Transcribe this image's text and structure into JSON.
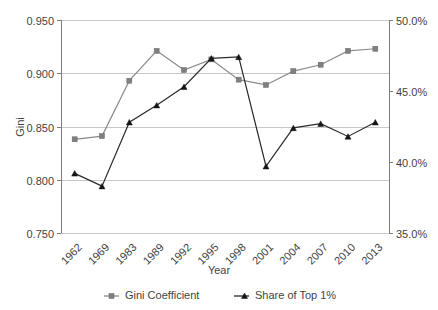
{
  "chart_data": {
    "type": "line",
    "title": "",
    "xlabel": "Year",
    "ylabel": "Gini",
    "ylabel_right": "",
    "categories": [
      "1962",
      "1969",
      "1983",
      "1989",
      "1992",
      "1995",
      "1998",
      "2001",
      "2004",
      "2007",
      "2010",
      "2013"
    ],
    "ylim": [
      0.75,
      0.95
    ],
    "ylim_right": [
      35.0,
      50.0
    ],
    "y_ticks": [
      "0.750",
      "0.800",
      "0.850",
      "0.900",
      "0.950"
    ],
    "y_tick_values": [
      0.75,
      0.8,
      0.85,
      0.9,
      0.95
    ],
    "y_ticks_right": [
      "35.0%",
      "40.0%",
      "45.0%",
      "50.0%"
    ],
    "y_tick_values_right": [
      35.0,
      40.0,
      45.0,
      50.0
    ],
    "grid": true,
    "legend_position": "bottom",
    "series": [
      {
        "name": "Gini Coefficient",
        "axis": "left",
        "marker": "square",
        "color": "#7f7f7f",
        "values": [
          0.838,
          0.841,
          0.893,
          0.921,
          0.903,
          0.913,
          0.894,
          0.889,
          0.902,
          0.908,
          0.921,
          0.923
        ]
      },
      {
        "name": "Share of Top 1%",
        "axis": "right",
        "marker": "triangle",
        "color": "#151515",
        "values": [
          39.2,
          38.3,
          42.8,
          44.0,
          45.3,
          47.3,
          47.4,
          39.7,
          42.4,
          42.7,
          41.8,
          42.8
        ]
      }
    ]
  },
  "legend": {
    "items": [
      {
        "label": "Gini Coefficient",
        "marker": "square-marker-icon"
      },
      {
        "label": "Share of Top 1%",
        "marker": "triangle-marker-icon"
      }
    ]
  },
  "axes": {
    "x_title": "Year",
    "y_title": "Gini"
  },
  "colors": {
    "gini_series": "#7f7f7f",
    "share_series": "#151515",
    "gridline": "#c8c8c8",
    "axis": "#7d7d7d",
    "text": "#3f3f3f",
    "background": "#ffffff"
  }
}
